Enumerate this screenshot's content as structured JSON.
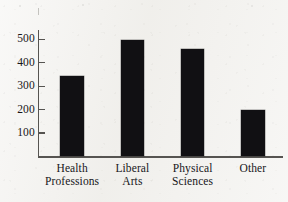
{
  "chart_data": {
    "type": "bar",
    "title": "",
    "subtitle": "",
    "xlabel": "",
    "ylabel": "",
    "categories": [
      "Health Professions",
      "Liberal Arts",
      "Physical Sciences",
      "Other"
    ],
    "category_lines": [
      [
        "Health",
        "Professions"
      ],
      [
        "Liberal",
        "Arts"
      ],
      [
        "Physical",
        "Sciences"
      ],
      [
        "Other"
      ]
    ],
    "values": [
      345,
      497,
      460,
      200
    ],
    "ylim": [
      0,
      540
    ],
    "yticks": [
      100,
      200,
      300,
      400,
      500
    ],
    "ytick_labels": [
      "100",
      "200",
      "300",
      "400",
      "500"
    ],
    "grid": false,
    "legend": false,
    "legend_position": "none",
    "bar_color": "#111013",
    "axis_color": "#565451",
    "text_color": "#17161a",
    "background_color": "#f2f1ee"
  }
}
